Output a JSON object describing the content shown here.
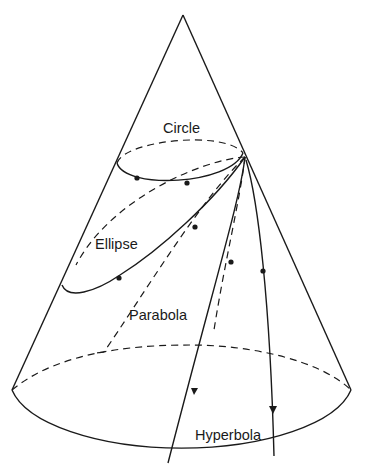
{
  "diagram": {
    "labels": {
      "circle": "Circle",
      "ellipse": "Ellipse",
      "parabola": "Parabola",
      "hyperbola": "Hyperbola"
    },
    "colors": {
      "line": "#1a1a1a",
      "background": "#ffffff"
    }
  }
}
